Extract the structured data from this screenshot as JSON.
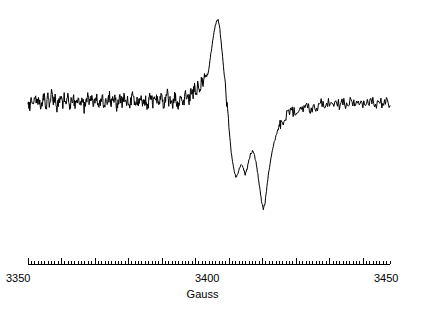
{
  "figure": {
    "background_color": "#ffffff",
    "trace_color": "#000000",
    "axis_color": "#000000"
  },
  "axis": {
    "title": "Gauss",
    "tick_labels": [
      "3350",
      "3400",
      "3450"
    ],
    "line": {
      "x_start": 28,
      "x_end": 390,
      "y": 14
    },
    "minor_tick_spacing_px": 3.35,
    "major_tick_every": 10,
    "minor_tick_height": 3,
    "major_tick_height": 6
  },
  "chart_data": {
    "type": "line",
    "title": "",
    "xlabel": "Gauss",
    "ylabel": "",
    "xlim": [
      3350,
      3450
    ],
    "ylim": [
      -1.35,
      1.0
    ],
    "grid": false,
    "legend": null,
    "annotations": [],
    "series": [
      {
        "name": "EPR derivative signal",
        "color": "#000000",
        "x": [
          3350.0,
          3350.5,
          3351.0,
          3351.5,
          3352.0,
          3352.5,
          3353.0,
          3353.5,
          3354.0,
          3354.5,
          3355.0,
          3355.5,
          3356.0,
          3356.5,
          3357.0,
          3357.5,
          3358.0,
          3358.5,
          3359.0,
          3359.5,
          3360.0,
          3360.5,
          3361.0,
          3361.5,
          3362.0,
          3362.5,
          3363.0,
          3363.5,
          3364.0,
          3364.5,
          3365.0,
          3365.5,
          3366.0,
          3366.5,
          3367.0,
          3367.5,
          3368.0,
          3368.5,
          3369.0,
          3369.5,
          3370.0,
          3370.5,
          3371.0,
          3371.5,
          3372.0,
          3372.5,
          3373.0,
          3373.5,
          3374.0,
          3374.5,
          3375.0,
          3375.5,
          3376.0,
          3376.5,
          3377.0,
          3377.5,
          3378.0,
          3378.5,
          3379.0,
          3379.5,
          3380.0,
          3380.5,
          3381.0,
          3381.5,
          3382.0,
          3382.5,
          3383.0,
          3383.5,
          3384.0,
          3384.5,
          3385.0,
          3385.5,
          3386.0,
          3386.5,
          3387.0,
          3387.5,
          3388.0,
          3388.5,
          3389.0,
          3389.5,
          3390.0,
          3390.5,
          3391.0,
          3391.5,
          3392.0,
          3392.5,
          3393.0,
          3393.5,
          3394.0,
          3394.5,
          3395.0,
          3395.5,
          3396.0,
          3396.5,
          3397.0,
          3397.5,
          3398.0,
          3398.5,
          3399.0,
          3399.5,
          3400.0,
          3400.5,
          3401.0,
          3401.5,
          3402.0,
          3402.5,
          3403.0,
          3403.5,
          3404.0,
          3404.5,
          3405.0,
          3405.5,
          3406.0,
          3406.5,
          3407.0,
          3407.5,
          3408.0,
          3408.5,
          3409.0,
          3409.5,
          3410.0,
          3410.5,
          3411.0,
          3411.5,
          3412.0,
          3412.5,
          3413.0,
          3413.5,
          3414.0,
          3414.5,
          3415.0,
          3415.5,
          3416.0,
          3416.5,
          3417.0,
          3417.5,
          3418.0,
          3418.5,
          3419.0,
          3419.5,
          3420.0,
          3421.0,
          3422.0,
          3423.0,
          3424.0,
          3425.0,
          3426.0,
          3427.0,
          3428.0,
          3429.0,
          3430.0,
          3431.0,
          3432.0,
          3433.0,
          3434.0,
          3435.0,
          3436.0,
          3437.0,
          3438.0,
          3439.0,
          3440.0,
          3441.0,
          3442.0,
          3443.0,
          3444.0,
          3445.0,
          3446.0,
          3447.0,
          3448.0,
          3449.0,
          3450.0
        ],
        "y": [
          0.02,
          -0.06,
          0.07,
          -0.04,
          0.09,
          -0.02,
          0.05,
          -0.08,
          0.03,
          0.08,
          -0.05,
          0.06,
          -0.03,
          0.1,
          -0.01,
          0.04,
          -0.07,
          0.02,
          0.08,
          -0.04,
          0.06,
          -0.02,
          0.09,
          -0.06,
          0.03,
          0.07,
          -0.05,
          0.01,
          0.08,
          -0.03,
          0.05,
          -0.07,
          0.04,
          0.09,
          -0.02,
          0.06,
          -0.05,
          0.03,
          0.07,
          -0.04,
          0.02,
          0.08,
          -0.06,
          0.05,
          -0.01,
          0.09,
          -0.03,
          0.04,
          0.06,
          -0.07,
          0.02,
          0.08,
          -0.04,
          0.05,
          -0.02,
          0.07,
          -0.06,
          0.03,
          0.09,
          -0.01,
          0.04,
          -0.05,
          0.08,
          0.02,
          -0.03,
          0.06,
          -0.07,
          0.05,
          0.09,
          -0.02,
          0.03,
          0.07,
          -0.04,
          0.01,
          0.08,
          -0.06,
          0.04,
          0.1,
          -0.01,
          0.05,
          -0.03,
          0.08,
          0.02,
          -0.05,
          0.09,
          0.04,
          -0.02,
          0.11,
          0.06,
          0.01,
          0.13,
          0.08,
          0.18,
          0.12,
          0.22,
          0.17,
          0.28,
          0.24,
          0.33,
          0.3,
          0.42,
          0.58,
          0.74,
          0.88,
          0.96,
          1.0,
          0.88,
          0.66,
          0.42,
          0.18,
          -0.06,
          -0.3,
          -0.54,
          -0.72,
          -0.84,
          -0.9,
          -0.86,
          -0.78,
          -0.74,
          -0.8,
          -0.86,
          -0.8,
          -0.7,
          -0.62,
          -0.58,
          -0.63,
          -0.72,
          -0.86,
          -1.02,
          -1.18,
          -1.28,
          -1.2,
          -1.02,
          -0.84,
          -0.7,
          -0.58,
          -0.48,
          -0.4,
          -0.34,
          -0.28,
          -0.24,
          -0.18,
          -0.14,
          -0.1,
          -0.13,
          -0.07,
          -0.11,
          -0.05,
          -0.08,
          -0.03,
          -0.06,
          -0.01,
          -0.05,
          0.0,
          -0.04,
          0.01,
          -0.03,
          0.02,
          -0.05,
          0.0,
          -0.02,
          0.03,
          -0.04,
          0.01,
          -0.03,
          0.02,
          -0.06,
          0.0,
          -0.02,
          0.03,
          -0.04
        ]
      }
    ]
  }
}
